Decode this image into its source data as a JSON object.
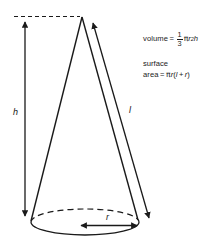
{
  "diagram": {
    "shape": "cone",
    "stroke_color": "#1a1a1a",
    "background_color": "#ffffff",
    "labels": {
      "height": "h",
      "slant": "l",
      "radius": "r"
    },
    "elements": {
      "apex": "cone-apex",
      "base": "cone-base-ellipse",
      "hidden_base_arc": "dashed-hidden-arc",
      "top_dashed_guide": "dashed-horizontal-guide",
      "height_arrow": "height-double-arrow",
      "slant_arrow": "slant-double-arrow",
      "radius_arrow": "radius-double-arrow"
    }
  },
  "formulas": {
    "volume": {
      "label": "volume",
      "equals": "=",
      "fraction_numerator": "1",
      "fraction_denominator": "3",
      "pi": "π",
      "radius_var": "r",
      "radius_exponent": "2",
      "height_var": "h",
      "plain_text": "volume = 1/3 πr²h"
    },
    "surface_area": {
      "line1": "surface",
      "label": "area",
      "equals": "=",
      "pi": "π",
      "radius_var": "r",
      "open_paren": "(",
      "slant_var": "l",
      "plus": "+",
      "radius_var2": "r",
      "close_paren": ")",
      "plain_text": "surface area = πr(l + r)"
    }
  }
}
